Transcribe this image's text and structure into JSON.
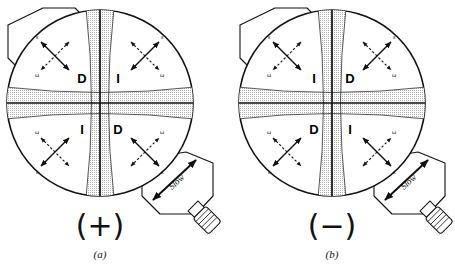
{
  "figure": {
    "background": "#ffffff",
    "ink": "#111111",
    "stipple": "#c9c9c9"
  },
  "panels": [
    {
      "id": "a",
      "caption_symbol": "(+)",
      "caption_letter": "(a)",
      "sign": "+",
      "quadrants": [
        {
          "position": "top-left",
          "label": "D",
          "fast_axis": "ε",
          "slow_axis": "ω",
          "eps_corner": "upper-left",
          "omega_corner": "lower-left"
        },
        {
          "position": "top-right",
          "label": "I",
          "fast_axis": "ε",
          "slow_axis": "ω",
          "eps_corner": "upper-right",
          "omega_corner": "lower-right"
        },
        {
          "position": "bottom-left",
          "label": "I",
          "fast_axis": "ε",
          "slow_axis": "ω",
          "eps_corner": "lower-left",
          "omega_corner": "upper-left"
        },
        {
          "position": "bottom-right",
          "label": "D",
          "fast_axis": "ε",
          "slow_axis": "ω",
          "eps_corner": "lower-right",
          "omega_corner": "upper-right"
        }
      ],
      "slow_label": "Slow"
    },
    {
      "id": "b",
      "caption_symbol": "(−)",
      "caption_letter": "(b)",
      "sign": "−",
      "quadrants": [
        {
          "position": "top-left",
          "label": "I",
          "fast_axis": "ε",
          "slow_axis": "ω",
          "eps_corner": "upper-left",
          "omega_corner": "lower-left"
        },
        {
          "position": "top-right",
          "label": "D",
          "fast_axis": "ε",
          "slow_axis": "ω",
          "eps_corner": "upper-right",
          "omega_corner": "lower-right"
        },
        {
          "position": "bottom-left",
          "label": "D",
          "fast_axis": "ε",
          "slow_axis": "ω",
          "eps_corner": "lower-left",
          "omega_corner": "upper-left"
        },
        {
          "position": "bottom-right",
          "label": "I",
          "fast_axis": "ε",
          "slow_axis": "ω",
          "eps_corner": "lower-right",
          "omega_corner": "upper-right"
        }
      ],
      "slow_label": "Slow"
    }
  ]
}
